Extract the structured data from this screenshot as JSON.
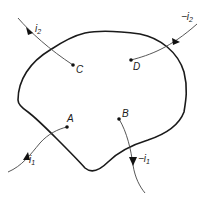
{
  "diagram": {
    "type": "current paths through conducting region",
    "region": {
      "name": "closed-region"
    },
    "points": [
      {
        "id": "A",
        "label": "A",
        "x": 67,
        "y": 127
      },
      {
        "id": "B",
        "label": "B",
        "x": 119,
        "y": 119
      },
      {
        "id": "C",
        "label": "C",
        "x": 73,
        "y": 65
      },
      {
        "id": "D",
        "label": "D",
        "x": 131,
        "y": 60
      }
    ],
    "currents": [
      {
        "id": "i1",
        "label_main": "i",
        "label_sub": "1",
        "label_prefix": "",
        "direction": "into region to A"
      },
      {
        "id": "neg_i1",
        "label_main": "i",
        "label_sub": "1",
        "label_prefix": "−",
        "direction": "out of region from B"
      },
      {
        "id": "i2",
        "label_main": "i",
        "label_sub": "2",
        "label_prefix": "",
        "direction": "into region to C"
      },
      {
        "id": "neg_i2",
        "label_main": "i",
        "label_sub": "2",
        "label_prefix": "−",
        "direction": "out of region from D"
      }
    ],
    "colors": {
      "line": "#1a1a1a",
      "wire": "#444444",
      "background": "#ffffff"
    }
  }
}
